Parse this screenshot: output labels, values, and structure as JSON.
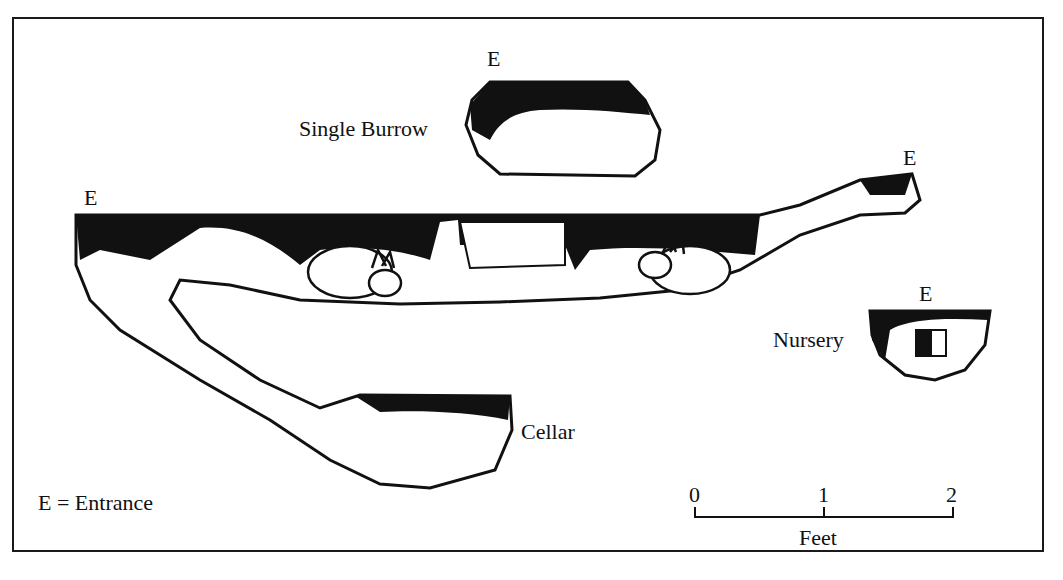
{
  "diagram": {
    "entrance_marker": "E",
    "labels": {
      "single_burrow": "Single Burrow",
      "nursery": "Nursery",
      "cellar": "Cellar"
    },
    "legend": "E = Entrance",
    "scale": {
      "ticks": [
        "0",
        "1",
        "2"
      ],
      "unit": "Feet"
    }
  }
}
